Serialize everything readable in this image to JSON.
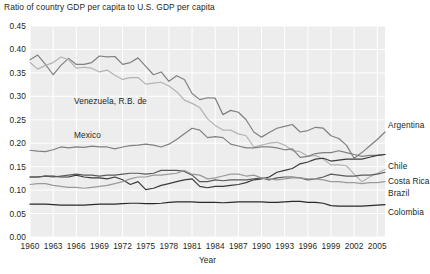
{
  "chart_data": {
    "type": "line",
    "title": "Ratio of country GDP per capita to U.S. GDP per capita",
    "xlabel": "Year",
    "ylabel": "",
    "xlim": [
      1960,
      2006
    ],
    "ylim": [
      0.0,
      0.45
    ],
    "grid": true,
    "legend_position": "inline-right",
    "ytick_labels": [
      "0.45",
      "0.40",
      "0.35",
      "0.30",
      "0.25",
      "0.20",
      "0.15",
      "0.10",
      "0.05",
      "0.00"
    ],
    "ytick_values": [
      0.45,
      0.4,
      0.35,
      0.3,
      0.25,
      0.2,
      0.15,
      0.1,
      0.05,
      0.0
    ],
    "xtick_labels": [
      "1960",
      "1963",
      "1966",
      "1969",
      "1972",
      "1975",
      "1978",
      "1981",
      "1984",
      "1987",
      "1990",
      "1993",
      "1996",
      "1999",
      "2002",
      "2005"
    ],
    "xtick_values": [
      1960,
      1963,
      1966,
      1969,
      1972,
      1975,
      1978,
      1981,
      1984,
      1987,
      1990,
      1993,
      1996,
      1999,
      2002,
      2005
    ],
    "x": [
      1960,
      1961,
      1962,
      1963,
      1964,
      1965,
      1966,
      1967,
      1968,
      1969,
      1970,
      1971,
      1972,
      1973,
      1974,
      1975,
      1976,
      1977,
      1978,
      1979,
      1980,
      1981,
      1982,
      1983,
      1984,
      1985,
      1986,
      1987,
      1988,
      1989,
      1990,
      1991,
      1992,
      1993,
      1994,
      1995,
      1996,
      1997,
      1998,
      1999,
      2000,
      2001,
      2002,
      2003,
      2004,
      2005,
      2006
    ],
    "series": [
      {
        "name": "Argentina",
        "color": "#808080",
        "label_position": "right",
        "values": [
          0.378,
          0.388,
          0.368,
          0.346,
          0.366,
          0.381,
          0.368,
          0.368,
          0.372,
          0.386,
          0.384,
          0.385,
          0.368,
          0.372,
          0.382,
          0.364,
          0.346,
          0.352,
          0.332,
          0.344,
          0.336,
          0.306,
          0.293,
          0.297,
          0.296,
          0.261,
          0.27,
          0.266,
          0.25,
          0.224,
          0.213,
          0.223,
          0.232,
          0.236,
          0.24,
          0.224,
          0.227,
          0.234,
          0.232,
          0.216,
          0.21,
          0.196,
          0.168,
          0.18,
          0.194,
          0.208,
          0.224
        ]
      },
      {
        "name": "Venezuela, R.B. de",
        "color": "#b3b3b3",
        "label_position": "inline",
        "values": [
          0.372,
          0.358,
          0.366,
          0.372,
          0.384,
          0.378,
          0.36,
          0.362,
          0.36,
          0.352,
          0.356,
          0.345,
          0.336,
          0.34,
          0.34,
          0.326,
          0.328,
          0.33,
          0.322,
          0.31,
          0.292,
          0.285,
          0.276,
          0.252,
          0.238,
          0.228,
          0.228,
          0.22,
          0.216,
          0.192,
          0.196,
          0.2,
          0.202,
          0.196,
          0.184,
          0.182,
          0.172,
          0.174,
          0.166,
          0.154,
          0.154,
          0.152,
          0.134,
          0.118,
          0.128,
          0.136,
          0.144
        ]
      },
      {
        "name": "Mexico",
        "color": "#808080",
        "label_position": "inline",
        "values": [
          0.185,
          0.183,
          0.182,
          0.186,
          0.192,
          0.19,
          0.192,
          0.191,
          0.194,
          0.192,
          0.192,
          0.188,
          0.192,
          0.195,
          0.196,
          0.198,
          0.196,
          0.192,
          0.198,
          0.208,
          0.22,
          0.232,
          0.228,
          0.212,
          0.214,
          0.212,
          0.198,
          0.194,
          0.19,
          0.19,
          0.192,
          0.192,
          0.19,
          0.186,
          0.188,
          0.17,
          0.172,
          0.178,
          0.18,
          0.18,
          0.184,
          0.18,
          0.176,
          0.172,
          0.174,
          0.174,
          0.176
        ]
      },
      {
        "name": "Chile",
        "color": "#3a3a3a",
        "label_position": "right",
        "values": [
          0.128,
          0.128,
          0.13,
          0.13,
          0.128,
          0.128,
          0.132,
          0.128,
          0.126,
          0.126,
          0.124,
          0.128,
          0.122,
          0.112,
          0.118,
          0.101,
          0.104,
          0.11,
          0.114,
          0.118,
          0.122,
          0.124,
          0.108,
          0.105,
          0.108,
          0.108,
          0.11,
          0.112,
          0.116,
          0.122,
          0.124,
          0.128,
          0.138,
          0.142,
          0.146,
          0.156,
          0.16,
          0.166,
          0.168,
          0.162,
          0.164,
          0.166,
          0.166,
          0.166,
          0.17,
          0.174,
          0.176
        ]
      },
      {
        "name": "Costa Rica",
        "color": "#5a5a5a",
        "label_position": "right",
        "values": [
          0.128,
          0.128,
          0.13,
          0.128,
          0.13,
          0.132,
          0.134,
          0.132,
          0.132,
          0.13,
          0.132,
          0.132,
          0.134,
          0.136,
          0.136,
          0.134,
          0.136,
          0.142,
          0.142,
          0.142,
          0.14,
          0.132,
          0.118,
          0.118,
          0.122,
          0.12,
          0.122,
          0.122,
          0.122,
          0.124,
          0.126,
          0.122,
          0.126,
          0.128,
          0.128,
          0.126,
          0.122,
          0.124,
          0.128,
          0.134,
          0.132,
          0.13,
          0.13,
          0.132,
          0.132,
          0.134,
          0.138
        ]
      },
      {
        "name": "Brazil",
        "color": "#9a9a9a",
        "label_position": "right",
        "values": [
          0.112,
          0.114,
          0.114,
          0.11,
          0.108,
          0.106,
          0.106,
          0.104,
          0.106,
          0.108,
          0.11,
          0.114,
          0.118,
          0.124,
          0.128,
          0.128,
          0.132,
          0.132,
          0.134,
          0.136,
          0.142,
          0.134,
          0.132,
          0.124,
          0.126,
          0.13,
          0.134,
          0.134,
          0.13,
          0.132,
          0.126,
          0.124,
          0.122,
          0.124,
          0.126,
          0.126,
          0.124,
          0.124,
          0.122,
          0.118,
          0.118,
          0.116,
          0.116,
          0.114,
          0.116,
          0.116,
          0.118
        ]
      },
      {
        "name": "Colombia",
        "color": "#2a2a2a",
        "label_position": "right",
        "values": [
          0.07,
          0.07,
          0.07,
          0.069,
          0.068,
          0.068,
          0.068,
          0.068,
          0.069,
          0.07,
          0.07,
          0.07,
          0.071,
          0.072,
          0.072,
          0.071,
          0.071,
          0.072,
          0.074,
          0.075,
          0.075,
          0.075,
          0.074,
          0.074,
          0.074,
          0.073,
          0.074,
          0.075,
          0.075,
          0.075,
          0.075,
          0.074,
          0.074,
          0.075,
          0.076,
          0.076,
          0.074,
          0.074,
          0.072,
          0.067,
          0.066,
          0.066,
          0.066,
          0.066,
          0.067,
          0.068,
          0.069
        ]
      }
    ],
    "inline_annotations": [
      {
        "text": "Venezuela, R.B. de",
        "x_px": 74,
        "y_px": 96
      },
      {
        "text": "Mexico",
        "x_px": 74,
        "y_px": 130
      }
    ],
    "right_labels": [
      {
        "text": "Argentina",
        "y_px": 120
      },
      {
        "text": "Chile",
        "y_px": 161
      },
      {
        "text": "Costa Rica",
        "y_px": 176
      },
      {
        "text": "Brazil",
        "y_px": 188
      },
      {
        "text": "Colombia",
        "y_px": 207
      }
    ],
    "source_note": ""
  },
  "plot_style": {
    "plot_bg": "#ededed",
    "grid_color": "#ffffff",
    "page_bg": "#ffffff",
    "text_color": "#231f20"
  }
}
